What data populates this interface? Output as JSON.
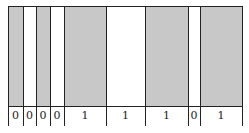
{
  "diagram": {
    "cells": [
      {
        "value": "0",
        "filled": true
      },
      {
        "value": "0",
        "filled": false
      },
      {
        "value": "0",
        "filled": true
      },
      {
        "value": "0",
        "filled": false
      },
      {
        "value": "1",
        "filled": true
      },
      {
        "value": "1",
        "filled": false
      },
      {
        "value": "1",
        "filled": true
      },
      {
        "value": "0",
        "filled": false
      },
      {
        "value": "1",
        "filled": true
      }
    ],
    "boundaries_x": [
      8,
      23,
      36,
      50,
      64,
      106,
      145,
      188,
      200,
      242
    ],
    "colors": {
      "fill": "#c8c8c8",
      "line": "#222222",
      "background": "#ffffff"
    }
  }
}
